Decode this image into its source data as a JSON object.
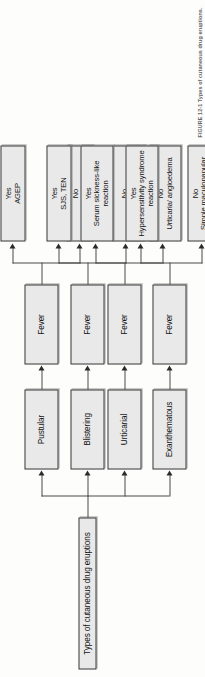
{
  "figure": {
    "orientation": "rotated-90-ccw",
    "root": {
      "label": "Types of cutaneous drug eruptions"
    },
    "decision_label": "Fever",
    "caption": "FIGURE 12-1   Types of cutaneous drug eruptions.",
    "colors": {
      "box_fill": "#e9e9e9",
      "box_border": "#3a3a3a",
      "line": "#4a4a4a",
      "text": "#141414",
      "page_background": "#fdfdfc"
    },
    "branches": [
      {
        "category": "Pustular",
        "decision": "Fever",
        "yes": {
          "answer": "Yes",
          "outcome": "AGEP"
        },
        "no": {
          "answer": "No",
          "outcome": "Acneiform"
        }
      },
      {
        "category": "Blistering",
        "decision": "Fever",
        "yes": {
          "answer": "Yes",
          "outcome": "SJS, TEN"
        },
        "no": {
          "answer": "No",
          "outcome": "Bullous fixed drug eruption"
        }
      },
      {
        "category": "Urticarial",
        "decision": "Fever",
        "yes": {
          "answer": "Yes",
          "outcome": "Serum sickness-like reaction"
        },
        "no": {
          "answer": "No",
          "outcome": "Urticaria/ angioedema"
        }
      },
      {
        "category": "Exanthematous",
        "decision": "Fever",
        "yes": {
          "answer": "Yes",
          "outcome": "Hypersensitivity syndrome reaction"
        },
        "no": {
          "answer": "No",
          "outcome": "Simple maculopapular eruption"
        }
      }
    ]
  }
}
